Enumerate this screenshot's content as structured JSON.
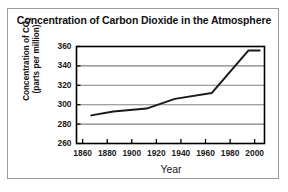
{
  "figure": {
    "title": "Concentration of Carbon Dioxide in the Atmosphere",
    "x_axis_title": "Year",
    "y_axis_title_line1": "Concentration of CO",
    "y_axis_title_sub": "2",
    "y_axis_title_line2": "(parts per million)",
    "line_color": "#1a1a1a",
    "grid_color": "#808080",
    "frame_color": "#000000",
    "border_color": "#9b9b9b",
    "background_color": "#ffffff"
  },
  "chart_data": {
    "type": "line",
    "title": "Concentration of Carbon Dioxide in the Atmosphere",
    "xlabel": "Year",
    "ylabel": "Concentration of CO2 (parts per million)",
    "xlim": [
      1855,
      2008
    ],
    "ylim": [
      260,
      360
    ],
    "xticks": [
      1860,
      1880,
      1900,
      1920,
      1940,
      1960,
      1980,
      2000
    ],
    "yticks": [
      260,
      280,
      300,
      320,
      340,
      360
    ],
    "xtick_labels": [
      "1860",
      "1880",
      "1900",
      "1920",
      "1940",
      "1960",
      "1980",
      "2000"
    ],
    "ytick_labels": [
      "260",
      "280",
      "300",
      "320",
      "340",
      "360"
    ],
    "grid": true,
    "grid_axis": "y",
    "legend": false,
    "series": [
      {
        "name": "Atmospheric CO2",
        "x": [
          1867,
          1885,
          1912,
          1935,
          1965,
          1995,
          2004
        ],
        "y": [
          289,
          293,
          296,
          306,
          312,
          356,
          356
        ]
      }
    ]
  }
}
